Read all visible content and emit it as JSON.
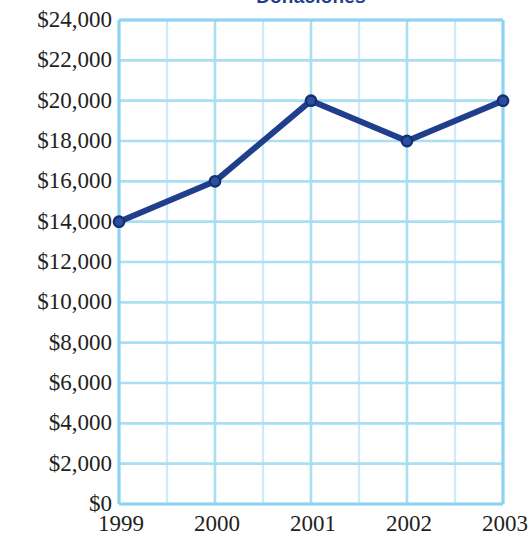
{
  "chart_data": {
    "type": "line",
    "title": "Donaciones",
    "xlabel": "",
    "ylabel": "",
    "categories": [
      "1999",
      "2000",
      "2001",
      "2002",
      "2003"
    ],
    "values": [
      14000,
      16000,
      20000,
      18000,
      20000
    ],
    "series": [
      {
        "name": "Donaciones",
        "values": [
          14000,
          16000,
          20000,
          18000,
          20000
        ]
      }
    ],
    "points": [
      {
        "x": "1999",
        "y": 14000,
        "label": "$14,000"
      },
      {
        "x": "2000",
        "y": 16000,
        "label": "$16,000"
      },
      {
        "x": "2001",
        "y": 20000,
        "label": "$20,000"
      },
      {
        "x": "2002",
        "y": 18000,
        "label": "$18,000"
      },
      {
        "x": "2003",
        "y": 20000,
        "label": "$20,000"
      }
    ],
    "ylim": [
      0,
      24000
    ],
    "ytick_step": 2000,
    "ytick_labels": [
      "$24,000",
      "$22,000",
      "$20,000",
      "$18,000",
      "$16,000",
      "$14,000",
      "$12,000",
      "$10,000",
      "$8,000",
      "$6,000",
      "$4,000",
      "$2,000",
      "$0"
    ],
    "ytick_values": [
      24000,
      22000,
      20000,
      18000,
      16000,
      14000,
      12000,
      10000,
      8000,
      6000,
      4000,
      2000,
      0
    ],
    "xtick_labels": [
      "1999",
      "2000",
      "2001",
      "2002",
      "2003"
    ],
    "grid": true,
    "grid_minor_x": true,
    "legend": "none",
    "colors": {
      "series_line": "#1f3f8c",
      "marker_fill": "#2a4fa2",
      "marker_stroke": "#15306e",
      "grid_major": "#a9dff2",
      "grid_minor": "#c9ecf8",
      "axis": "#8ed3ef",
      "title": "#1f3f8c",
      "tick_text": "#231f20",
      "background": "#ffffff"
    }
  }
}
